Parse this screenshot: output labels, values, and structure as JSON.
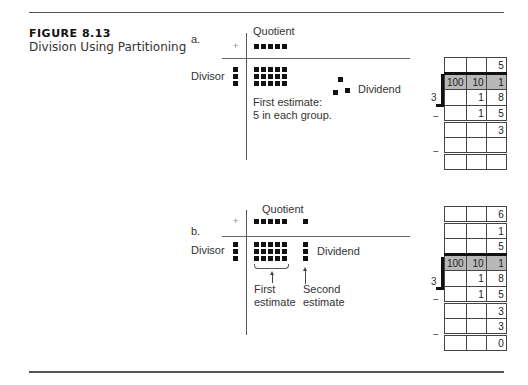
{
  "figure": {
    "number": "FIGURE 8.13",
    "title": "Division Using Partitioning"
  },
  "part_a": {
    "label": "a.",
    "plus": "+",
    "quotient_label": "Quotient",
    "quotient_blocks": 5,
    "divisor_label": "Divisor",
    "divisor_blocks": 3,
    "dividend_label": "Dividend",
    "grouped_blocks": {
      "rows": 3,
      "cols": 5
    },
    "remainder_blocks": 3,
    "note_line1": "First estimate:",
    "note_line2": "5 in each group.",
    "table": {
      "quotient_rows": [
        [
          "",
          "",
          "5"
        ]
      ],
      "header": [
        "100",
        "10",
        "1"
      ],
      "divisor": "3",
      "rows": [
        {
          "sign": "",
          "cells": [
            "",
            "1",
            "8"
          ]
        },
        {
          "sign": "−",
          "cells": [
            "",
            "1",
            "5"
          ]
        },
        {
          "sign": "",
          "cells": [
            "",
            "",
            "3"
          ]
        },
        {
          "sign": "−",
          "cells": [
            "",
            "",
            ""
          ]
        },
        {
          "sign": "",
          "cells": [
            "",
            "",
            ""
          ]
        }
      ]
    }
  },
  "part_b": {
    "label": "b.",
    "plus": "+",
    "quotient_label": "Quotient",
    "quotient_blocks": 5,
    "quotient_extra_blocks": 1,
    "divisor_label": "Divisor",
    "divisor_blocks": 3,
    "dividend_label": "Dividend",
    "grouped_blocks": {
      "rows": 3,
      "cols": 5
    },
    "second_group_blocks": 3,
    "first_estimate_line1": "First",
    "first_estimate_line2": "estimate",
    "second_estimate_line1": "Second",
    "second_estimate_line2": "estimate",
    "table": {
      "quotient_rows": [
        [
          "",
          "",
          "6"
        ],
        [
          "",
          "",
          "1"
        ],
        [
          "",
          "",
          "5"
        ]
      ],
      "header": [
        "100",
        "10",
        "1"
      ],
      "divisor": "3",
      "rows": [
        {
          "sign": "",
          "cells": [
            "",
            "1",
            "8"
          ]
        },
        {
          "sign": "−",
          "cells": [
            "",
            "1",
            "5"
          ]
        },
        {
          "sign": "",
          "cells": [
            "",
            "",
            "3"
          ]
        },
        {
          "sign": "−",
          "cells": [
            "",
            "",
            "3"
          ]
        },
        {
          "sign": "",
          "cells": [
            "",
            "",
            "0"
          ]
        }
      ]
    }
  }
}
